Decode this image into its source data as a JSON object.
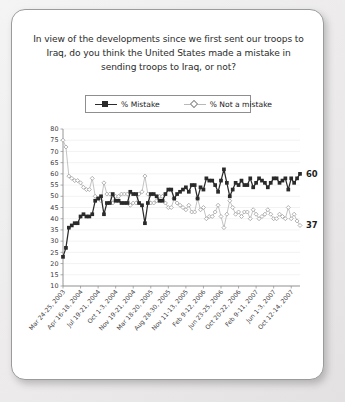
{
  "card": {
    "question": "In view of the developments since we first sent our troops to Iraq, do you think the United States made a mistake in sending troops to Iraq, or not?"
  },
  "legend": {
    "position": "top-center",
    "items": [
      {
        "label": "% Mistake",
        "marker": "filled-square",
        "color": "#2a2a2a"
      },
      {
        "label": "% Not a mistake",
        "marker": "open-diamond",
        "color": "#b8b8b8"
      }
    ]
  },
  "end_labels": {
    "mistake": "60",
    "not_a_mistake": "37"
  },
  "chart_data": {
    "type": "line",
    "title": "In view of the developments since we first sent our troops to Iraq, do you think the United States made a mistake in sending troops to Iraq, or not?",
    "xlabel": "",
    "ylabel": "",
    "ylim": [
      10,
      80
    ],
    "ytick_step": 5,
    "yticks": [
      10,
      15,
      20,
      25,
      30,
      35,
      40,
      45,
      50,
      55,
      60,
      65,
      70,
      75,
      80
    ],
    "grid": "horizontal",
    "legend_position": "top-center",
    "xtick_labels": [
      "Mar 24-25, 2003",
      "Apr 16-18, 2004",
      "Jul 19-21, 2004",
      "Oct 1-3, 2004",
      "Nov 19-21, 2004",
      "Mar 18-20, 2005",
      "Aug 28-30, 2005",
      "Nov 11-13, 2005",
      "Feb 9-12, 2006",
      "Jun 23-25, 2006",
      "Oct 20-22, 2006",
      "Feb 9-11, 2007",
      "Jun 1-3, 2007",
      "Oct 12-14, 2007"
    ],
    "xtick_positions": [
      0,
      6,
      12,
      18,
      24,
      30,
      36,
      42,
      48,
      54,
      60,
      66,
      72,
      78
    ],
    "series": [
      {
        "name": "% Mistake",
        "color": "#2a2a2a",
        "marker": "filled-square",
        "end_value": 60,
        "values": [
          23,
          27,
          36,
          37,
          38,
          38,
          41,
          42,
          41,
          41,
          42,
          48,
          49,
          50,
          42,
          47,
          47,
          51,
          48,
          48,
          47,
          47,
          47,
          52,
          51,
          51,
          47,
          46,
          38,
          47,
          51,
          51,
          50,
          48,
          48,
          51,
          53,
          53,
          49,
          51,
          52,
          53,
          54,
          52,
          55,
          55,
          49,
          54,
          53,
          58,
          57,
          57,
          55,
          52,
          57,
          62,
          56,
          50,
          53,
          56,
          55,
          57,
          55,
          55,
          58,
          54,
          56,
          58,
          57,
          56,
          54,
          56,
          58,
          58,
          56,
          57,
          58,
          53,
          58,
          56,
          58,
          60
        ]
      },
      {
        "name": "% Not a mistake",
        "color": "#b8b8b8",
        "marker": "open-diamond",
        "end_value": 37,
        "values": [
          75,
          72,
          59,
          58,
          57,
          57,
          56,
          54,
          53,
          53,
          58,
          50,
          49,
          48,
          56,
          51,
          51,
          47,
          50,
          50,
          51,
          51,
          51,
          46,
          47,
          47,
          51,
          52,
          59,
          51,
          47,
          47,
          48,
          50,
          50,
          47,
          45,
          45,
          49,
          47,
          46,
          45,
          44,
          46,
          43,
          43,
          49,
          44,
          45,
          40,
          41,
          41,
          43,
          46,
          41,
          36,
          42,
          48,
          45,
          42,
          43,
          41,
          43,
          43,
          40,
          44,
          42,
          40,
          41,
          42,
          44,
          42,
          40,
          40,
          42,
          41,
          40,
          45,
          40,
          42,
          39,
          37
        ]
      }
    ]
  }
}
